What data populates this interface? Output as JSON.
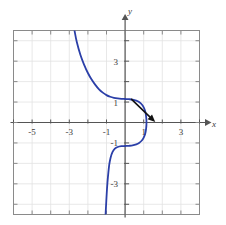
{
  "chart_data": {
    "type": "line",
    "title": "",
    "subtitle": "",
    "xlabel": "x",
    "ylabel": "y",
    "xlim": [
      -6,
      4
    ],
    "ylim": [
      -4.5,
      4.5
    ],
    "grid": true,
    "grid_spacing": 1,
    "legend": "none",
    "x_tick_labels": [
      "-5",
      "-3",
      "-1",
      "1",
      "3"
    ],
    "x_tick_values": [
      -5,
      -3,
      -1,
      1,
      3
    ],
    "y_tick_labels": [
      "3",
      "1",
      "-1",
      "-3"
    ],
    "y_tick_values": [
      3,
      1,
      -1,
      -3
    ],
    "minor_tick_values_x": [
      -6,
      -5,
      -4,
      -3,
      -2,
      -1,
      0,
      1,
      2,
      3,
      4
    ],
    "minor_tick_values_y": [
      -4,
      -3,
      -2,
      -1,
      0,
      1,
      2,
      3,
      4
    ],
    "series": [
      {
        "name": "curve",
        "color": "#2B3FA8",
        "style": "solid",
        "width": 1.8,
        "points": [
          [
            -2.72,
            4.5
          ],
          [
            -2.6,
            3.95
          ],
          [
            -2.4,
            3.3
          ],
          [
            -2.2,
            2.82
          ],
          [
            -2.0,
            2.42
          ],
          [
            -1.8,
            2.1
          ],
          [
            -1.6,
            1.84
          ],
          [
            -1.4,
            1.62
          ],
          [
            -1.2,
            1.46
          ],
          [
            -1.0,
            1.34
          ],
          [
            -0.8,
            1.26
          ],
          [
            -0.6,
            1.21
          ],
          [
            -0.4,
            1.18
          ],
          [
            -0.2,
            1.16
          ],
          [
            0.0,
            1.15
          ],
          [
            0.2,
            1.14
          ],
          [
            0.4,
            1.12
          ],
          [
            0.6,
            1.07
          ],
          [
            0.75,
            1.0
          ],
          [
            0.9,
            0.88
          ],
          [
            1.0,
            0.74
          ],
          [
            1.08,
            0.55
          ],
          [
            1.13,
            0.3
          ],
          [
            1.15,
            0.0
          ],
          [
            1.13,
            -0.3
          ],
          [
            1.08,
            -0.55
          ],
          [
            1.0,
            -0.74
          ],
          [
            0.9,
            -0.88
          ],
          [
            0.75,
            -1.0
          ],
          [
            0.6,
            -1.07
          ],
          [
            0.4,
            -1.12
          ],
          [
            0.2,
            -1.14
          ],
          [
            0.0,
            -1.15
          ],
          [
            -0.2,
            -1.16
          ],
          [
            -0.4,
            -1.2
          ],
          [
            -0.55,
            -1.28
          ],
          [
            -0.68,
            -1.45
          ],
          [
            -0.78,
            -1.72
          ],
          [
            -0.85,
            -2.05
          ],
          [
            -0.9,
            -2.45
          ],
          [
            -0.95,
            -2.95
          ],
          [
            -0.99,
            -3.5
          ],
          [
            -1.02,
            -4.0
          ],
          [
            -1.05,
            -4.5
          ]
        ]
      }
    ],
    "annotations": [
      {
        "name": "tangent-arrow",
        "type": "arrow",
        "color": "#121212",
        "from": [
          0.35,
          1.13
        ],
        "to": [
          1.62,
          0.02
        ],
        "width": 1.6
      }
    ]
  },
  "axes": {
    "x_axis_label": "x",
    "y_axis_label": "y",
    "x_axis_color": "#555555",
    "y_axis_color": "#555555",
    "frame_color": "#8a8a8a",
    "grid_color": "#e2e2e2"
  },
  "colors": {
    "curve": "#2B3FA8",
    "arrow": "#121212",
    "background": "#ffffff",
    "tick_text": "#3a3a3a"
  }
}
